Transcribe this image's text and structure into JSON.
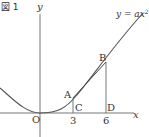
{
  "figure": {
    "title": "図 1",
    "equation": {
      "lhs": "y",
      "eq": " = ",
      "rhs": "ax",
      "exp": "2"
    },
    "axes": {
      "x_label": "x",
      "y_label": "y",
      "origin_label": "O"
    },
    "points": {
      "A": "A",
      "B": "B",
      "C": "C",
      "D": "D"
    },
    "ticks": {
      "c_value": "3",
      "d_value": "6"
    },
    "colors": {
      "line": "#555555",
      "text": "#333333"
    }
  },
  "diagram": {
    "curve": "y = ax^2 (parabola through origin)",
    "A": {
      "x": 3,
      "on": "parabola"
    },
    "B": {
      "x": 6,
      "on": "parabola"
    },
    "C": {
      "x": 3,
      "y": 0
    },
    "D": {
      "x": 6,
      "y": 0
    },
    "segments": [
      "AB",
      "AC",
      "BD"
    ]
  }
}
